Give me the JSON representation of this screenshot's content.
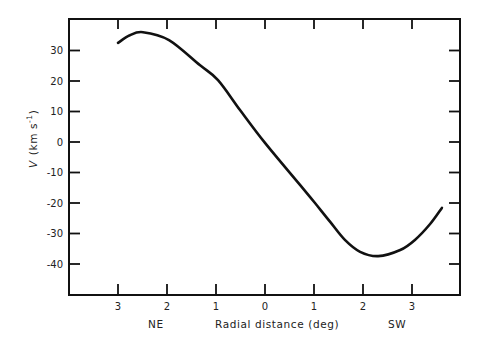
{
  "chart_data": {
    "type": "line",
    "title": "",
    "xlabel": "Radial distance (deg)",
    "ylabel": "V (km s-1)",
    "ylabel_main": "V",
    "ylabel_units": "(km s",
    "ylabel_sup": "-1",
    "ylabel_close": ")",
    "x_direction_labels": {
      "left": "NE",
      "right": "SW"
    },
    "xlim": [
      -4.0,
      4.0
    ],
    "ylim": [
      -50,
      38
    ],
    "x_ticks": [
      -3,
      -2,
      -1,
      0,
      1,
      2,
      3
    ],
    "x_tick_labels": [
      "3",
      "2",
      "1",
      "0",
      "1",
      "2",
      "3"
    ],
    "y_ticks": [
      30,
      20,
      10,
      0,
      -10,
      -20,
      -30,
      -40
    ],
    "y_tick_labels": [
      "30",
      "20",
      "10",
      "0",
      "-10",
      "-20",
      "-30",
      "-40"
    ],
    "grid": false,
    "legend": null,
    "series": [
      {
        "name": "velocity curve",
        "x": [
          -3.0,
          -2.76,
          -2.49,
          -1.96,
          -1.33,
          -0.96,
          -0.51,
          0.0,
          0.71,
          1.02,
          1.33,
          1.63,
          1.94,
          2.31,
          2.76,
          3.06,
          3.37,
          3.61
        ],
        "y": [
          32.5,
          35.0,
          36.0,
          33.4,
          25.2,
          20.3,
          10.5,
          -0.3,
          -14.0,
          -20.0,
          -26.2,
          -32.1,
          -36.0,
          -37.4,
          -35.4,
          -32.1,
          -26.9,
          -21.6
        ]
      }
    ]
  },
  "colors": {
    "line": "#111111",
    "axis": "#111111",
    "text": "#222222",
    "background": "#ffffff"
  }
}
